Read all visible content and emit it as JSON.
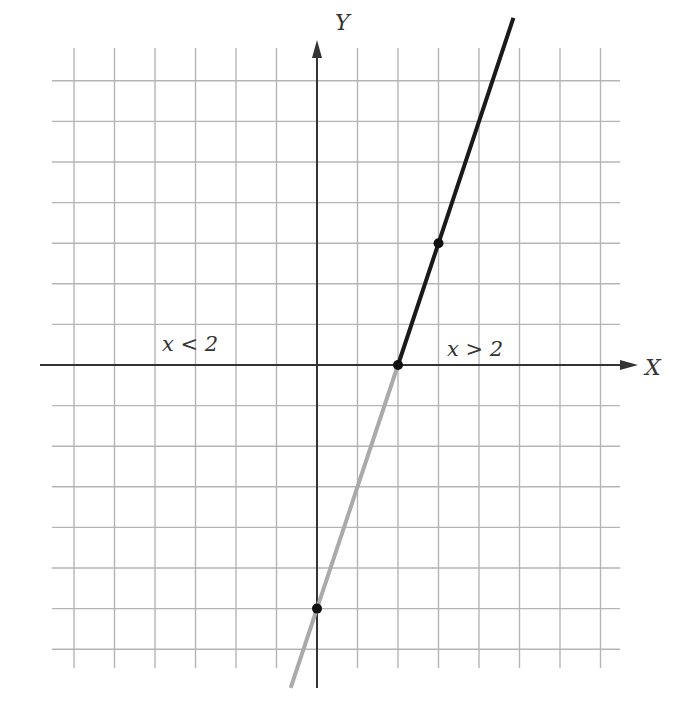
{
  "chart_data": {
    "type": "line",
    "title": "",
    "xlabel": "X",
    "ylabel": "Y",
    "xlim": [
      -6,
      7
    ],
    "ylim": [
      -7,
      8
    ],
    "grid": true,
    "series": [
      {
        "name": "y = 3x - 6 (x > 2)",
        "style": "dark",
        "color": "#1a1a1a",
        "x": [
          2,
          2.9,
          4.85
        ],
        "y": [
          0,
          2.7,
          8.55
        ]
      },
      {
        "name": "y = 3x - 6 (x < 2)",
        "style": "light",
        "color": "#aaaaaa",
        "x": [
          -0.65,
          0,
          2
        ],
        "y": [
          -7.95,
          -6,
          0
        ]
      }
    ],
    "points": [
      {
        "x": 2,
        "y": 0
      },
      {
        "x": 3,
        "y": 3
      },
      {
        "x": 0,
        "y": -6
      }
    ],
    "annotations": [
      {
        "text": "x<2",
        "x": -3.5,
        "y": 0.5
      },
      {
        "text": "x>2",
        "x": 3.1,
        "y": 0.5
      }
    ]
  },
  "labels": {
    "x_axis": "X",
    "y_axis": "Y",
    "left_region": "x < 2",
    "right_region": "x > 2"
  },
  "colors": {
    "grid": "#b5b5b5",
    "axis": "#333333",
    "line_dark": "#1a1a1a",
    "line_light": "#aaaaaa"
  }
}
